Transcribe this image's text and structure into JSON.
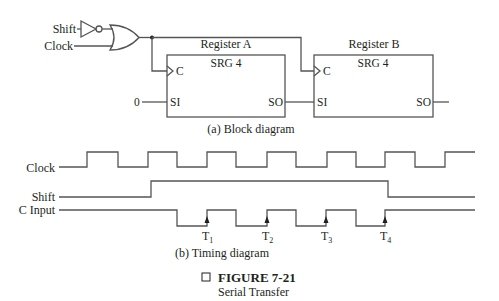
{
  "block_diagram": {
    "inputs": {
      "shift": "Shift",
      "clock": "Clock"
    },
    "register_a": {
      "name": "Register A",
      "type": "SRG 4",
      "clock_pin": "C",
      "serial_in": "SI",
      "serial_out": "SO",
      "serial_in_value": "0"
    },
    "register_b": {
      "name": "Register B",
      "type": "SRG 4",
      "clock_pin": "C",
      "serial_in": "SI",
      "serial_out": "SO"
    },
    "caption": "(a) Block diagram"
  },
  "timing_diagram": {
    "signals": {
      "clock": "Clock",
      "shift": "Shift",
      "c_input": "C Input"
    },
    "markers": [
      {
        "label": "T",
        "sub": "1"
      },
      {
        "label": "T",
        "sub": "2"
      },
      {
        "label": "T",
        "sub": "3"
      },
      {
        "label": "T",
        "sub": "4"
      }
    ],
    "caption": "(b) Timing diagram"
  },
  "figure": {
    "number": "FIGURE 7-21",
    "title": "Serial Transfer",
    "marker_icon": "square-outline-icon"
  }
}
